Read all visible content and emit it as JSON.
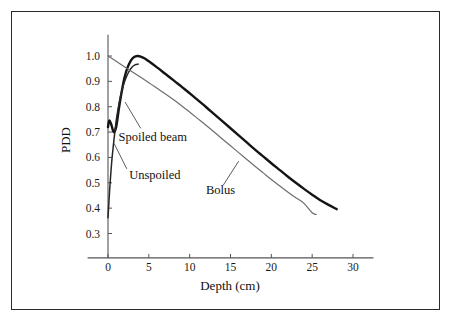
{
  "chart_data": {
    "type": "line",
    "title": "",
    "xlabel": "Depth (cm)",
    "ylabel": "PDD",
    "xlim": [
      -2.5,
      32.5
    ],
    "ylim": [
      0.255,
      1.06
    ],
    "xticks": [
      0,
      5,
      10,
      15,
      20,
      25,
      30
    ],
    "xtick_labels": [
      "0",
      "5",
      "10",
      "15",
      "20",
      "25",
      "30"
    ],
    "yticks": [
      0.3,
      0.4,
      0.5,
      0.6,
      0.7,
      0.8,
      0.9,
      1.0
    ],
    "ytick_labels": [
      "0.3",
      "0.4",
      "0.5",
      "0.6",
      "0.7",
      "0.8",
      "0.9",
      "1.0"
    ],
    "grid": false,
    "legend_position": "inline-annotations",
    "series": [
      {
        "name": "Spoiled beam",
        "color": "#141414",
        "width": 2.4,
        "x": [
          0.0,
          0.15,
          0.4,
          0.7,
          1.0,
          1.3,
          1.6,
          2.0,
          2.4,
          2.8,
          3.2,
          3.6,
          4.0,
          4.5,
          5.0,
          6.0,
          7.0,
          8.0,
          9.0,
          10.0,
          11.0,
          12.0,
          13.0,
          14.0,
          15.0,
          16.0,
          17.0,
          18.0,
          19.0,
          20.0,
          21.0,
          22.0,
          23.0,
          24.0,
          25.0,
          26.0,
          27.0,
          28.0
        ],
        "y": [
          0.72,
          0.745,
          0.73,
          0.7,
          0.72,
          0.785,
          0.845,
          0.912,
          0.955,
          0.982,
          0.996,
          1.0,
          0.998,
          0.99,
          0.979,
          0.955,
          0.93,
          0.905,
          0.879,
          0.853,
          0.826,
          0.799,
          0.771,
          0.743,
          0.715,
          0.687,
          0.659,
          0.631,
          0.604,
          0.577,
          0.551,
          0.525,
          0.5,
          0.476,
          0.453,
          0.431,
          0.413,
          0.396
        ]
      },
      {
        "name": "Unspoiled",
        "color": "#262626",
        "width": 1.5,
        "x": [
          0.0,
          0.2,
          0.45,
          0.75,
          1.05,
          1.4,
          1.75,
          2.1,
          2.5,
          2.9,
          3.3,
          3.7
        ],
        "y": [
          0.362,
          0.47,
          0.58,
          0.675,
          0.755,
          0.82,
          0.87,
          0.905,
          0.935,
          0.955,
          0.965,
          0.968
        ]
      },
      {
        "name": "Bolus",
        "color": "#6e6e6e",
        "width": 1.2,
        "x": [
          0.0,
          1.0,
          2.0,
          3.0,
          4.0,
          5.0,
          6.0,
          7.0,
          8.0,
          9.0,
          10.0,
          11.0,
          12.0,
          13.0,
          14.0,
          15.0,
          16.0,
          17.0,
          18.0,
          19.0,
          20.0,
          21.0,
          22.0,
          23.0,
          24.0,
          25.0,
          25.5
        ],
        "y": [
          1.0,
          0.979,
          0.958,
          0.937,
          0.916,
          0.895,
          0.873,
          0.851,
          0.828,
          0.804,
          0.779,
          0.753,
          0.727,
          0.7,
          0.673,
          0.646,
          0.619,
          0.592,
          0.565,
          0.539,
          0.513,
          0.488,
          0.464,
          0.441,
          0.419,
          0.382,
          0.375
        ]
      }
    ],
    "annotations": [
      {
        "name": "spoiled-beam",
        "text": "Spoiled beam",
        "text_x": 1.3,
        "text_y": 0.665,
        "leader_from": [
          4.0,
          0.715
        ],
        "leader_to": [
          2.1,
          0.818
        ]
      },
      {
        "name": "unspoiled",
        "text": "Unspoiled",
        "text_x": 2.6,
        "text_y": 0.515,
        "leader_from": [
          2.3,
          0.555
        ],
        "leader_to": [
          0.75,
          0.655
        ]
      },
      {
        "name": "bolus",
        "text": "Bolus",
        "text_x": 12.0,
        "text_y": 0.455,
        "leader_from": [
          14.1,
          0.49
        ],
        "leader_to": [
          16.0,
          0.585
        ]
      }
    ]
  },
  "figure": {
    "border_color": "#2b2b2b",
    "background": "#ffffff"
  }
}
